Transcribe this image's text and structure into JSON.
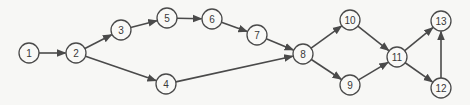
{
  "diagram": {
    "type": "directed-network",
    "colors": {
      "background": "#f7f7f5",
      "stroke": "#4a4a4a",
      "node_fill": "#f9f9f7",
      "text": "#3a3a3a"
    },
    "node_radius": 10,
    "nodes": [
      {
        "id": "1",
        "label": "1",
        "x": 29,
        "y": 53
      },
      {
        "id": "2",
        "label": "2",
        "x": 76,
        "y": 53
      },
      {
        "id": "3",
        "label": "3",
        "x": 121,
        "y": 30
      },
      {
        "id": "4",
        "label": "4",
        "x": 166,
        "y": 84
      },
      {
        "id": "5",
        "label": "5",
        "x": 167,
        "y": 18
      },
      {
        "id": "6",
        "label": "6",
        "x": 212,
        "y": 19
      },
      {
        "id": "7",
        "label": "7",
        "x": 257,
        "y": 35
      },
      {
        "id": "8",
        "label": "8",
        "x": 303,
        "y": 54
      },
      {
        "id": "9",
        "label": "9",
        "x": 350,
        "y": 85
      },
      {
        "id": "10",
        "label": "10",
        "x": 350,
        "y": 20
      },
      {
        "id": "11",
        "label": "11",
        "x": 397,
        "y": 57
      },
      {
        "id": "12",
        "label": "12",
        "x": 441,
        "y": 88
      },
      {
        "id": "13",
        "label": "13",
        "x": 441,
        "y": 21
      }
    ],
    "edges": [
      {
        "from": "1",
        "to": "2"
      },
      {
        "from": "2",
        "to": "3"
      },
      {
        "from": "2",
        "to": "4"
      },
      {
        "from": "3",
        "to": "5"
      },
      {
        "from": "5",
        "to": "6"
      },
      {
        "from": "6",
        "to": "7"
      },
      {
        "from": "7",
        "to": "8"
      },
      {
        "from": "4",
        "to": "8"
      },
      {
        "from": "8",
        "to": "10"
      },
      {
        "from": "8",
        "to": "9"
      },
      {
        "from": "10",
        "to": "11"
      },
      {
        "from": "9",
        "to": "11"
      },
      {
        "from": "11",
        "to": "13"
      },
      {
        "from": "11",
        "to": "12"
      },
      {
        "from": "12",
        "to": "13"
      }
    ]
  }
}
